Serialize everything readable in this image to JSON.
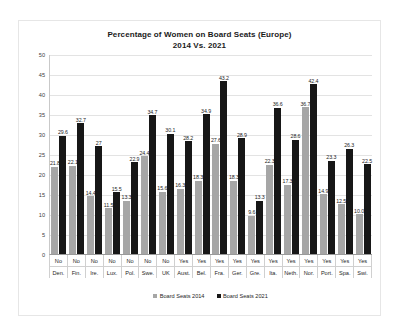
{
  "chart_data": {
    "type": "bar",
    "title": "Percentage of Women on Board Seats (Europe)",
    "subtitle": "2014 Vs. 2021",
    "xlabel": "",
    "ylabel": "",
    "ylim": [
      0,
      50
    ],
    "yticks": [
      50,
      45,
      40,
      35,
      30,
      25,
      20,
      15,
      10,
      5,
      0
    ],
    "grid": true,
    "legend_position": "bottom",
    "categories": [
      "Den.",
      "Fin.",
      "Ire.",
      "Lux.",
      "Pol.",
      "Swe.",
      "UK",
      "Aust.",
      "Bel.",
      "Fra.",
      "Ger.",
      "Gre.",
      "Ita.",
      "Neth.",
      "Nor.",
      "Port.",
      "Spa.",
      "Swi."
    ],
    "quota": [
      "No",
      "No",
      "No",
      "No",
      "No",
      "No",
      "No",
      "Yes",
      "Yes",
      "Yes",
      "Yes",
      "Yes",
      "Yes",
      "Yes",
      "Yes",
      "Yes",
      "Yes",
      "Yes"
    ],
    "series": [
      {
        "name": "Board Seats 2014",
        "color": "#a6a6a6",
        "values": [
          21.8,
          22.1,
          14.4,
          11.5,
          13.3,
          24.4,
          15.6,
          16.3,
          18.3,
          27.6,
          18.3,
          9.6,
          22.3,
          17.3,
          36.7,
          14.9,
          12.5,
          10.0
        ],
        "labels": [
          "21.8",
          "22.1",
          "14.4",
          "11.5",
          "13.3",
          "24.4",
          "15.6",
          "16.3",
          "18.3",
          "27.6",
          "18.3",
          "9.6",
          "22.3",
          "17.3",
          "36.7",
          "14.9",
          "12.5",
          "10.0"
        ]
      },
      {
        "name": "Board Seats 2021",
        "color": "#171717",
        "values": [
          29.6,
          32.7,
          27.0,
          15.5,
          22.9,
          34.7,
          30.1,
          28.2,
          34.9,
          43.2,
          28.9,
          13.3,
          36.6,
          28.6,
          42.4,
          23.3,
          26.3,
          22.5
        ],
        "labels": [
          "29.6",
          "32.7",
          "27",
          "15.5",
          "22.9",
          "34.7",
          "30.1",
          "28.2",
          "34.9",
          "43.2",
          "28.9",
          "13.3",
          "36.6",
          "28.6",
          "42.4",
          "23.3",
          "26.3",
          "22.5"
        ]
      }
    ]
  }
}
